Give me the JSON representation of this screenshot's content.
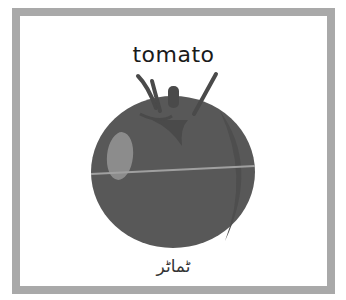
{
  "card": {
    "title": "tomato",
    "caption": "ٹماٹر",
    "image": "tomato-illustration"
  },
  "colors": {
    "border": "#a9a9a9",
    "tomato_body": "#555555",
    "stem": "#4a4a4a",
    "highlight": "#8a8a8a"
  }
}
